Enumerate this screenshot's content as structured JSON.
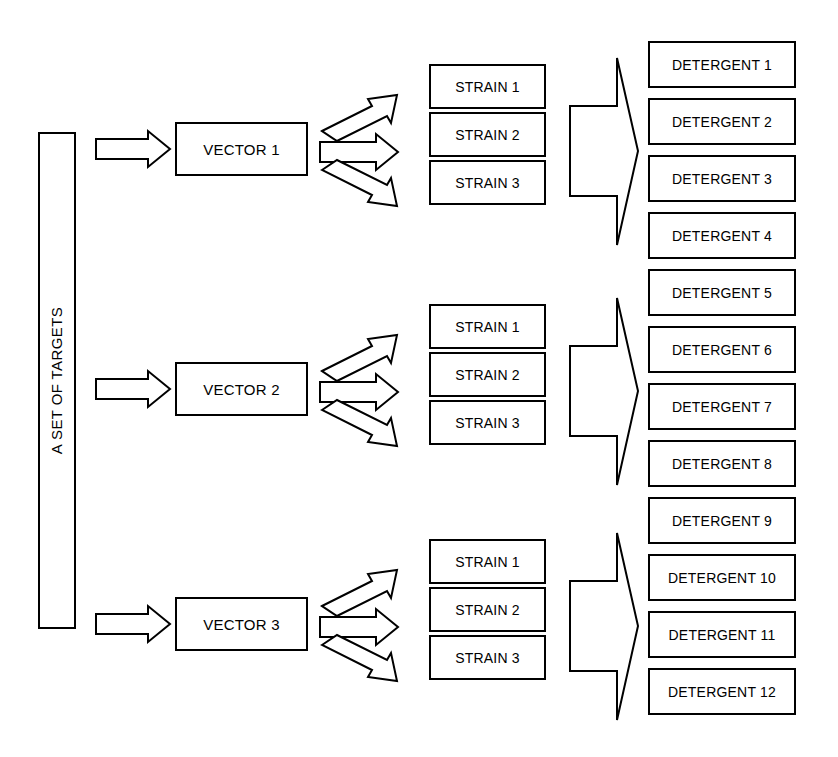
{
  "diagram": {
    "title_vertical": "A SET OF TARGETS",
    "bottom_caption": "",
    "line_color": "#000000",
    "background_color": "#ffffff",
    "groups": [
      {
        "vector_label": "VECTOR 1",
        "strains": [
          "STRAIN 1",
          "STRAIN 2",
          "STRAIN 3"
        ]
      },
      {
        "vector_label": "VECTOR 2",
        "strains": [
          "STRAIN 1",
          "STRAIN 2",
          "STRAIN 3"
        ]
      },
      {
        "vector_label": "VECTOR 3",
        "strains": [
          "STRAIN 1",
          "STRAIN 2",
          "STRAIN 3"
        ]
      }
    ],
    "detergents": [
      "DETERGENT 1",
      "DETERGENT 2",
      "DETERGENT 3",
      "DETERGENT 4",
      "DETERGENT 5",
      "DETERGENT 6",
      "DETERGENT 7",
      "DETERGENT 8",
      "DETERGENT 9",
      "DETERGENT 10",
      "DETERGENT 11",
      "DETERGENT 12"
    ]
  }
}
